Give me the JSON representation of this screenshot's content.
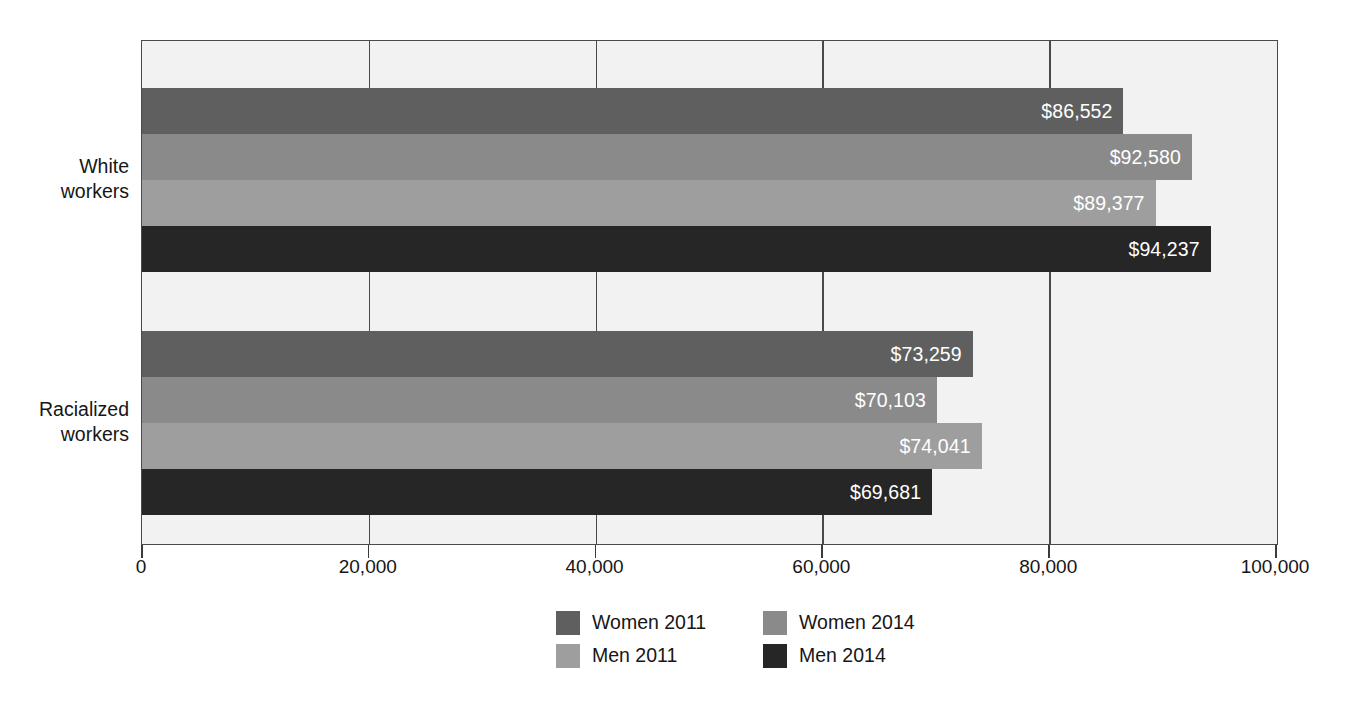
{
  "chart_data": {
    "type": "bar",
    "orientation": "horizontal",
    "title": "",
    "subtitle": "",
    "xlabel": "",
    "ylabel": "",
    "categories": [
      "White workers",
      "Racialized workers"
    ],
    "series": [
      {
        "name": "Women 2011",
        "color": "#5f5f5f",
        "values": [
          86552,
          73259
        ],
        "labels": [
          "$86,552",
          "$73,259"
        ]
      },
      {
        "name": "Women 2014",
        "color": "#8a8a8a",
        "values": [
          92580,
          70103
        ],
        "labels": [
          "$92,580",
          "$70,103"
        ]
      },
      {
        "name": "Men 2011",
        "color": "#9e9e9e",
        "values": [
          89377,
          74041
        ],
        "labels": [
          "$89,377",
          "$74,041"
        ]
      },
      {
        "name": "Men 2014",
        "color": "#262626",
        "values": [
          94237,
          69681
        ],
        "labels": [
          "$94,237",
          "$69,681"
        ]
      }
    ],
    "xlim": [
      0,
      100000
    ],
    "xticks": [
      0,
      20000,
      40000,
      60000,
      80000,
      100000
    ],
    "xticklabels": [
      "0",
      "20,000",
      "40,000",
      "60,000",
      "80,000",
      "100,000"
    ],
    "grid": "vertical",
    "legend_position": "bottom",
    "plot_background": "#f2f2f2",
    "value_label_color": "#ffffff"
  },
  "axis": {
    "ticks": [
      {
        "label": "0",
        "value": 0
      },
      {
        "label": "20,000",
        "value": 20000
      },
      {
        "label": "40,000",
        "value": 40000
      },
      {
        "label": "60,000",
        "value": 60000
      },
      {
        "label": "80,000",
        "value": 80000
      },
      {
        "label": "100,000",
        "value": 100000
      }
    ]
  },
  "groups": [
    {
      "label_line1": "White",
      "label_line2": "workers",
      "bars": [
        {
          "series": "Women 2011",
          "value_label": "$86,552"
        },
        {
          "series": "Women 2014",
          "value_label": "$92,580"
        },
        {
          "series": "Men 2011",
          "value_label": "$89,377"
        },
        {
          "series": "Men 2014",
          "value_label": "$94,237"
        }
      ]
    },
    {
      "label_line1": "Racialized",
      "label_line2": "workers",
      "bars": [
        {
          "series": "Women 2011",
          "value_label": "$73,259"
        },
        {
          "series": "Women 2014",
          "value_label": "$70,103"
        },
        {
          "series": "Men 2011",
          "value_label": "$74,041"
        },
        {
          "series": "Men 2014",
          "value_label": "$69,681"
        }
      ]
    }
  ],
  "legend": {
    "rows": [
      [
        {
          "label": "Women 2011",
          "color": "#5f5f5f"
        },
        {
          "label": "Women 2014",
          "color": "#8a8a8a"
        }
      ],
      [
        {
          "label": "Men 2011",
          "color": "#9e9e9e"
        },
        {
          "label": "Men 2014",
          "color": "#262626"
        }
      ]
    ]
  }
}
